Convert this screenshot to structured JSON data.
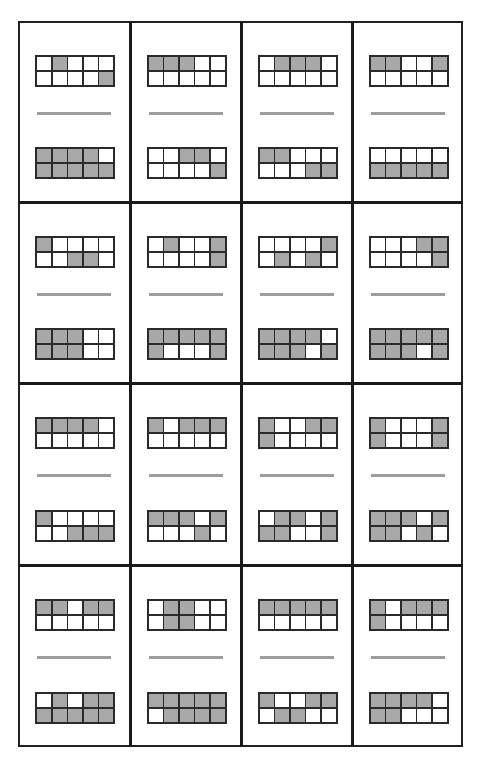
{
  "worksheet": {
    "title": "",
    "colors": {
      "filled": "#a8a8a8",
      "empty": "#ffffff",
      "border": "#2a2a2a",
      "fraction_bar": "#9e9e9e"
    },
    "layout": {
      "rows": 4,
      "columns": 4,
      "grid_cols": 5,
      "grid_rows": 2
    },
    "cards": [
      {
        "top": [
          [
            0,
            1,
            0,
            0,
            0
          ],
          [
            0,
            0,
            0,
            0,
            1
          ]
        ],
        "bottom": [
          [
            1,
            1,
            1,
            1,
            0
          ],
          [
            1,
            1,
            1,
            1,
            1
          ]
        ]
      },
      {
        "top": [
          [
            1,
            1,
            1,
            0,
            0
          ],
          [
            0,
            0,
            0,
            0,
            0
          ]
        ],
        "bottom": [
          [
            0,
            0,
            1,
            1,
            0
          ],
          [
            0,
            0,
            0,
            0,
            1
          ]
        ]
      },
      {
        "top": [
          [
            0,
            1,
            1,
            1,
            0
          ],
          [
            0,
            0,
            0,
            0,
            0
          ]
        ],
        "bottom": [
          [
            1,
            1,
            0,
            0,
            0
          ],
          [
            0,
            0,
            0,
            1,
            1
          ]
        ]
      },
      {
        "top": [
          [
            1,
            1,
            0,
            0,
            1
          ],
          [
            0,
            0,
            0,
            0,
            0
          ]
        ],
        "bottom": [
          [
            0,
            0,
            0,
            0,
            0
          ],
          [
            1,
            1,
            1,
            1,
            1
          ]
        ]
      },
      {
        "top": [
          [
            1,
            0,
            0,
            0,
            0
          ],
          [
            0,
            0,
            1,
            1,
            0
          ]
        ],
        "bottom": [
          [
            1,
            1,
            1,
            0,
            0
          ],
          [
            1,
            1,
            1,
            0,
            0
          ]
        ]
      },
      {
        "top": [
          [
            0,
            1,
            0,
            0,
            1
          ],
          [
            0,
            0,
            0,
            0,
            1
          ]
        ],
        "bottom": [
          [
            1,
            1,
            1,
            1,
            1
          ],
          [
            1,
            0,
            0,
            0,
            1
          ]
        ]
      },
      {
        "top": [
          [
            0,
            0,
            0,
            0,
            1
          ],
          [
            0,
            1,
            0,
            1,
            0
          ]
        ],
        "bottom": [
          [
            1,
            1,
            1,
            1,
            0
          ],
          [
            1,
            1,
            1,
            0,
            1
          ]
        ]
      },
      {
        "top": [
          [
            0,
            0,
            0,
            1,
            1
          ],
          [
            0,
            0,
            0,
            0,
            1
          ]
        ],
        "bottom": [
          [
            1,
            1,
            1,
            1,
            1
          ],
          [
            1,
            1,
            1,
            0,
            1
          ]
        ]
      },
      {
        "top": [
          [
            1,
            1,
            1,
            1,
            0
          ],
          [
            0,
            0,
            0,
            0,
            0
          ]
        ],
        "bottom": [
          [
            1,
            0,
            0,
            0,
            0
          ],
          [
            0,
            0,
            1,
            1,
            1
          ]
        ]
      },
      {
        "top": [
          [
            1,
            0,
            1,
            1,
            1
          ],
          [
            0,
            0,
            0,
            0,
            0
          ]
        ],
        "bottom": [
          [
            1,
            1,
            1,
            0,
            1
          ],
          [
            0,
            0,
            0,
            1,
            0
          ]
        ]
      },
      {
        "top": [
          [
            1,
            0,
            0,
            1,
            1
          ],
          [
            1,
            0,
            0,
            0,
            0
          ]
        ],
        "bottom": [
          [
            0,
            1,
            1,
            0,
            1
          ],
          [
            1,
            1,
            0,
            0,
            1
          ]
        ]
      },
      {
        "top": [
          [
            1,
            0,
            0,
            0,
            1
          ],
          [
            1,
            0,
            0,
            0,
            1
          ]
        ],
        "bottom": [
          [
            1,
            1,
            1,
            0,
            1
          ],
          [
            1,
            1,
            0,
            1,
            0
          ]
        ]
      },
      {
        "top": [
          [
            1,
            1,
            0,
            1,
            1
          ],
          [
            0,
            0,
            0,
            0,
            0
          ]
        ],
        "bottom": [
          [
            0,
            1,
            0,
            1,
            1
          ],
          [
            1,
            1,
            1,
            1,
            1
          ]
        ]
      },
      {
        "top": [
          [
            0,
            1,
            1,
            0,
            0
          ],
          [
            0,
            1,
            1,
            0,
            0
          ]
        ],
        "bottom": [
          [
            1,
            1,
            1,
            1,
            1
          ],
          [
            0,
            1,
            1,
            1,
            1
          ]
        ]
      },
      {
        "top": [
          [
            1,
            1,
            1,
            1,
            1
          ],
          [
            0,
            0,
            0,
            0,
            0
          ]
        ],
        "bottom": [
          [
            1,
            0,
            0,
            1,
            1
          ],
          [
            0,
            1,
            1,
            0,
            0
          ]
        ]
      },
      {
        "top": [
          [
            1,
            0,
            1,
            1,
            1
          ],
          [
            1,
            0,
            0,
            0,
            0
          ]
        ],
        "bottom": [
          [
            1,
            1,
            1,
            1,
            0
          ],
          [
            1,
            1,
            0,
            0,
            0
          ]
        ]
      }
    ]
  }
}
